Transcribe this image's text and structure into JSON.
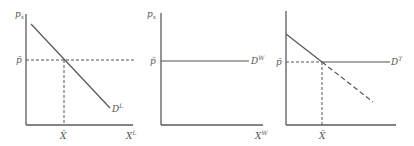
{
  "panels": [
    {
      "id": "local-demand",
      "y_axis_label": "p",
      "y_axis_sub": "x",
      "price_label": "p̄",
      "quantity_label": "X̄",
      "x_axis_label": "X",
      "x_axis_sup": "L",
      "curve_label": "D",
      "curve_sup": "L"
    },
    {
      "id": "world-demand",
      "y_axis_label": "p",
      "y_axis_sub": "x",
      "price_label": "p̄",
      "x_axis_label": "X",
      "x_axis_sup": "W",
      "curve_label": "D",
      "curve_sup": "W"
    },
    {
      "id": "total-demand",
      "price_label": "p̄",
      "quantity_label": "X̄",
      "curve_label": "D",
      "curve_sup": "T"
    }
  ],
  "colors": {
    "line": "#555555",
    "background": "#ffffff"
  }
}
